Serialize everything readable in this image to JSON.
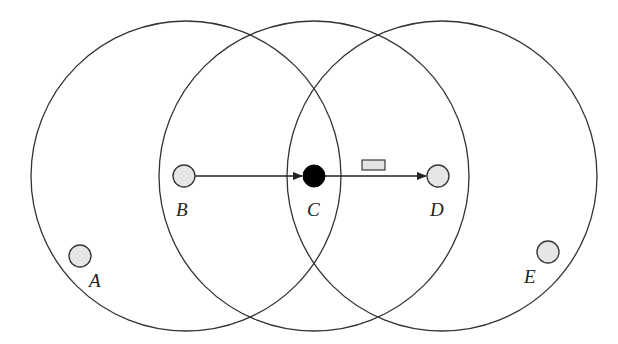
{
  "diagram": {
    "type": "wireless-transmission-range",
    "colors": {
      "background": "#ffffff",
      "circle_stroke": "#333333",
      "node_fill": "#e6e6e6",
      "active_node_fill": "#000000",
      "packet_fill": "#e2e2e2"
    },
    "ranges": [
      {
        "id": "range-B",
        "center_node": "B",
        "cx": 186,
        "cy": 176,
        "r": 155
      },
      {
        "id": "range-C",
        "center_node": "C",
        "cx": 314,
        "cy": 176,
        "r": 155
      },
      {
        "id": "range-D",
        "center_node": "D",
        "cx": 442,
        "cy": 176,
        "r": 155
      }
    ],
    "nodes": [
      {
        "id": "A",
        "label": "A",
        "x": 80,
        "y": 256,
        "r": 11,
        "state": "idle"
      },
      {
        "id": "B",
        "label": "B",
        "x": 184,
        "y": 176,
        "r": 11,
        "state": "idle"
      },
      {
        "id": "C",
        "label": "C",
        "x": 314,
        "y": 176,
        "r": 11,
        "state": "active"
      },
      {
        "id": "D",
        "label": "D",
        "x": 438,
        "y": 176,
        "r": 11,
        "state": "idle"
      },
      {
        "id": "E",
        "label": "E",
        "x": 548,
        "y": 252,
        "r": 11,
        "state": "idle"
      }
    ],
    "links": [
      {
        "from": "B",
        "to": "C",
        "directed": true
      },
      {
        "from": "C",
        "to": "D",
        "directed": true
      }
    ],
    "packet": {
      "on_link": "C-D",
      "x": 362,
      "y": 160,
      "w": 23,
      "h": 10
    },
    "labels": {
      "A": "A",
      "B": "B",
      "C": "C",
      "D": "D",
      "E": "E"
    }
  }
}
